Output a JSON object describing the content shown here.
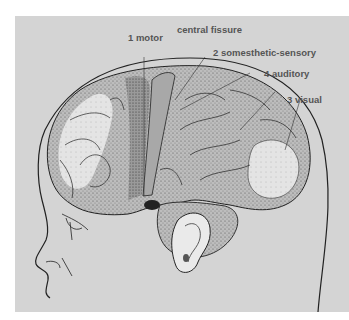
{
  "figure": {
    "type": "anatomical-illustration",
    "background_color": "#d4d4d4",
    "labels": [
      {
        "id": "motor",
        "text": "1 motor"
      },
      {
        "id": "central_fissure",
        "text": "central fissure"
      },
      {
        "id": "somesthetic",
        "text": "2 somesthetic-sensory"
      },
      {
        "id": "auditory",
        "text": "4 auditory"
      },
      {
        "id": "visual",
        "text": "3 visual"
      }
    ]
  }
}
